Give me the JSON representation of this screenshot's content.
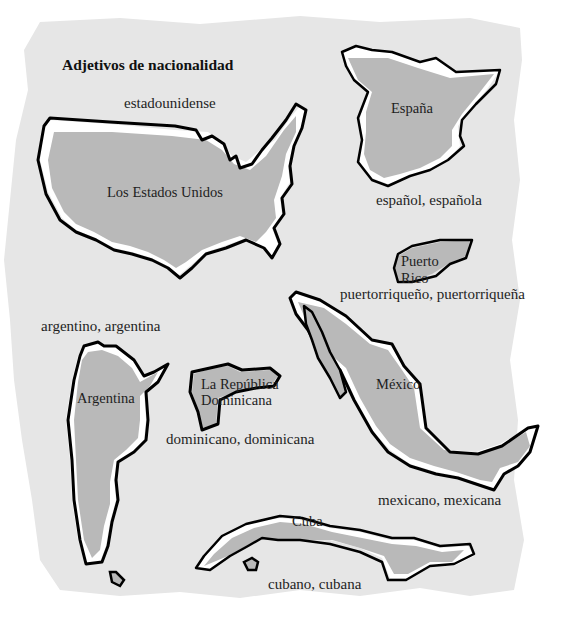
{
  "title": "Adjetivos de nacionalidad",
  "colors": {
    "page": "#ffffff",
    "backdrop": "#e6e6e6",
    "land": "#b9b9b9",
    "highlight": "#ffffff",
    "outline": "#000000",
    "text": "#1e1e1e"
  },
  "countries": [
    {
      "name": "Los Estados Unidos",
      "adjective": "estadounidense"
    },
    {
      "name": "España",
      "adjective": "español, española"
    },
    {
      "name": "Puerto Rico",
      "name_lines": [
        "Puerto",
        "Rico"
      ],
      "adjective": "puertorriqueño, puertorriqueña"
    },
    {
      "name": "México",
      "adjective": "mexicano, mexicana"
    },
    {
      "name": "Argentina",
      "adjective": "argentino, argentina"
    },
    {
      "name": "La República Dominicana",
      "name_lines": [
        "La República",
        "Dominicana"
      ],
      "adjective": "dominicano, dominicana"
    },
    {
      "name": "Cuba",
      "adjective": "cubano, cubana"
    }
  ]
}
